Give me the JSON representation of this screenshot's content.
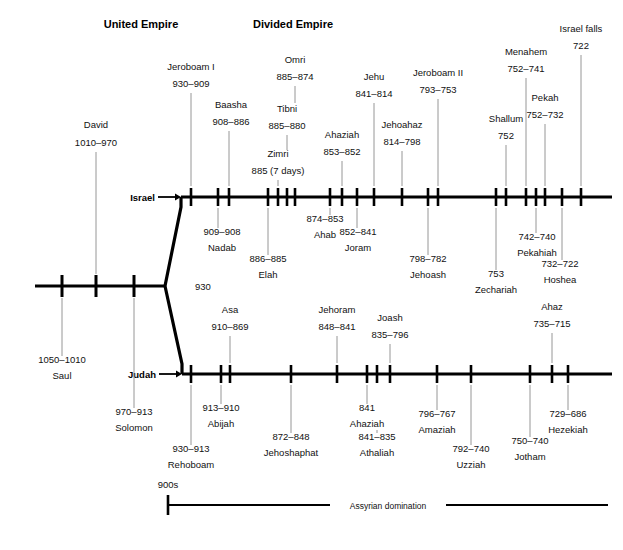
{
  "headers": {
    "united": "United Empire",
    "divided": "Divided Empire"
  },
  "axis_labels": {
    "israel": "Israel",
    "judah": "Judah"
  },
  "chart_data": {
    "type": "timeline",
    "fork_label": "930",
    "united_empire": {
      "name": "United Empire",
      "entries": [
        {
          "ruler": "Saul",
          "years": "1050–1010",
          "x": 62,
          "side": "below"
        },
        {
          "ruler": "David",
          "years": "1010–970",
          "x": 96,
          "side": "above"
        },
        {
          "ruler": "Solomon",
          "years": "970–913",
          "x": 134,
          "side": "below"
        }
      ]
    },
    "israel": {
      "name": "Israel",
      "entries": [
        {
          "ruler": "Jeroboam I",
          "years": "930–909",
          "x": 191,
          "side": "above"
        },
        {
          "ruler": "Nadab",
          "years": "909–908",
          "x": 218,
          "side": "below"
        },
        {
          "ruler": "Baasha",
          "years": "908–886",
          "x": 229,
          "side": "above"
        },
        {
          "ruler": "Elah",
          "years": "886–885",
          "x": 268,
          "side": "below"
        },
        {
          "ruler": "Zimri",
          "years": "885 (7 days)",
          "x": 278,
          "side": "above"
        },
        {
          "ruler": "Tibni",
          "years": "885–880",
          "x": 287,
          "side": "above"
        },
        {
          "ruler": "Omri",
          "years": "885–874",
          "x": 295,
          "side": "above"
        },
        {
          "ruler": "Ahab",
          "years": "874–853",
          "x": 330,
          "side": "below"
        },
        {
          "ruler": "Ahaziah",
          "years": "853–852",
          "x": 342,
          "side": "above"
        },
        {
          "ruler": "Joram",
          "years": "852–841",
          "x": 357,
          "side": "below"
        },
        {
          "ruler": "Jehu",
          "years": "841–814",
          "x": 374,
          "side": "above"
        },
        {
          "ruler": "Jehoahaz",
          "years": "814–798",
          "x": 402,
          "side": "above"
        },
        {
          "ruler": "Jehoash",
          "years": "798–782",
          "x": 428,
          "side": "below"
        },
        {
          "ruler": "Jeroboam II",
          "years": "793–753",
          "x": 438,
          "side": "above"
        },
        {
          "ruler": "Zechariah",
          "years": "753",
          "x": 496,
          "side": "below"
        },
        {
          "ruler": "Shallum",
          "years": "752",
          "x": 506,
          "side": "above"
        },
        {
          "ruler": "Menahem",
          "years": "752–741",
          "x": 526,
          "side": "above"
        },
        {
          "ruler": "Pekahiah",
          "years": "742–740",
          "x": 536,
          "side": "below"
        },
        {
          "ruler": "Pekah",
          "years": "752–732",
          "x": 545,
          "side": "above"
        },
        {
          "ruler": "Hoshea",
          "years": "732–722",
          "x": 562,
          "side": "below"
        },
        {
          "ruler": "Israel falls",
          "years": "722",
          "x": 581,
          "side": "above"
        }
      ]
    },
    "judah": {
      "name": "Judah",
      "entries": [
        {
          "ruler": "Rehoboam",
          "years": "930–913",
          "x": 191,
          "side": "below"
        },
        {
          "ruler": "Abijah",
          "years": "913–910",
          "x": 221,
          "side": "below"
        },
        {
          "ruler": "Asa",
          "years": "910–869",
          "x": 230,
          "side": "above"
        },
        {
          "ruler": "Jehoshaphat",
          "years": "872–848",
          "x": 291,
          "side": "below"
        },
        {
          "ruler": "Jehoram",
          "years": "848–841",
          "x": 337,
          "side": "above"
        },
        {
          "ruler": "Ahaziah",
          "years": "841",
          "x": 367,
          "side": "below"
        },
        {
          "ruler": "Athaliah",
          "years": "841–835",
          "x": 377,
          "side": "below"
        },
        {
          "ruler": "Joash",
          "years": "835–796",
          "x": 390,
          "side": "above"
        },
        {
          "ruler": "Amaziah",
          "years": "796–767",
          "x": 437,
          "side": "below"
        },
        {
          "ruler": "Uzziah",
          "years": "792–740",
          "x": 471,
          "side": "below"
        },
        {
          "ruler": "Jotham",
          "years": "750–740",
          "x": 530,
          "side": "below"
        },
        {
          "ruler": "Ahaz",
          "years": "735–715",
          "x": 552,
          "side": "above"
        },
        {
          "ruler": "Hezekiah",
          "years": "729–686",
          "x": 568,
          "side": "below"
        }
      ]
    },
    "bands": [
      {
        "label": "Assyrian domination",
        "start_label": "900s",
        "x_start": 168,
        "x_end": 608,
        "y": 505
      }
    ]
  }
}
